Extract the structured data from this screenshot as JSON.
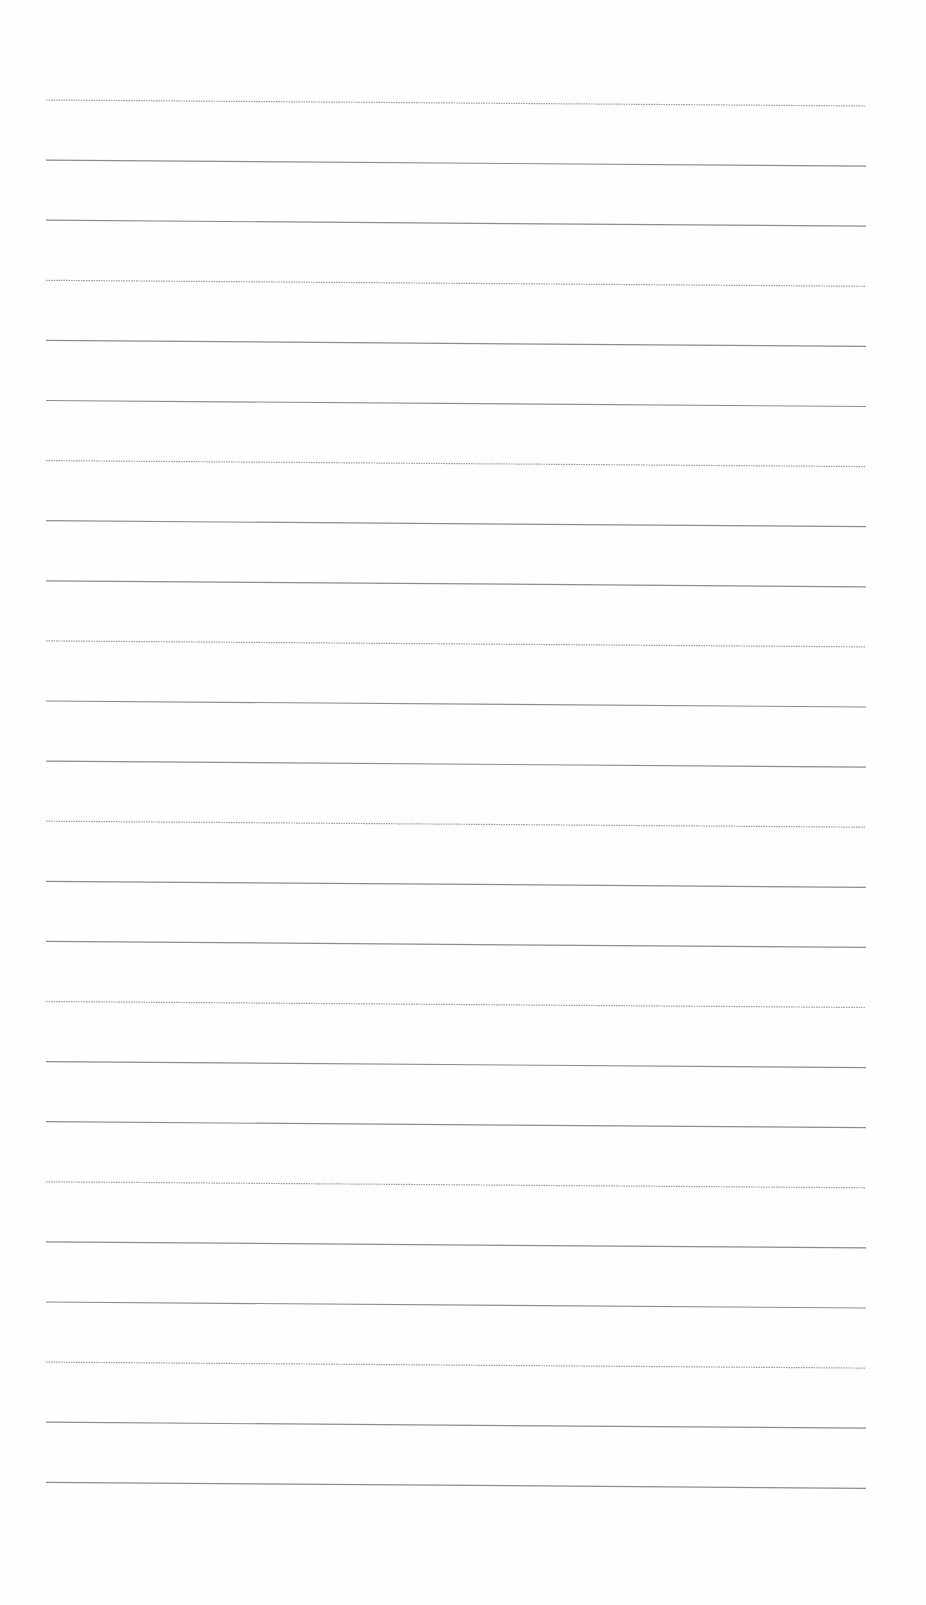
{
  "page": {
    "type": "blank-lined-sheet",
    "background": "#fefefe",
    "line_color": "#8d8d8d"
  },
  "lines": {
    "count": 24,
    "x_start": 46,
    "x_end": 866,
    "y_first": 100,
    "spacing": 60.1,
    "slope_drop": 6,
    "styles": [
      "dotted",
      "solid",
      "solid",
      "dotted",
      "solid",
      "solid",
      "dotted",
      "solid",
      "solid",
      "dotted",
      "solid",
      "solid",
      "dotted",
      "solid",
      "solid",
      "dotted",
      "solid",
      "solid",
      "dotted",
      "solid",
      "solid",
      "dotted",
      "solid",
      "solid"
    ]
  }
}
